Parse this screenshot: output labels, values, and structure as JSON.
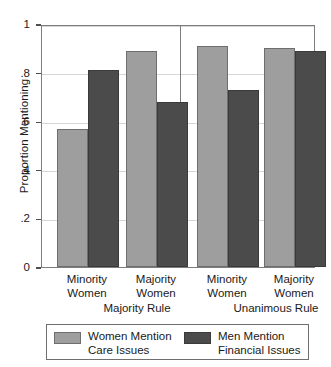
{
  "chart_data": {
    "type": "bar",
    "title": "",
    "xlabel": "",
    "ylabel": "Proportion Mentioning",
    "ylim": [
      0,
      1
    ],
    "yticks": [
      "0",
      ".2",
      ".4",
      ".6",
      ".8",
      "1"
    ],
    "ytick_values": [
      0,
      0.2,
      0.4,
      0.6,
      0.8,
      1
    ],
    "grid": true,
    "legend_position": "bottom",
    "categories": [
      "Minority Women",
      "Majority Women",
      "Minority Women",
      "Majority Women"
    ],
    "category_lines": [
      [
        "Minority",
        "Women"
      ],
      [
        "Majority",
        "Women"
      ],
      [
        "Minority",
        "Women"
      ],
      [
        "Majority",
        "Women"
      ]
    ],
    "groups": [
      {
        "label": "Majority Rule",
        "categories": [
          "Minority Women",
          "Majority Women"
        ]
      },
      {
        "label": "Unanimous Rule",
        "categories": [
          "Minority Women",
          "Majority Women"
        ]
      }
    ],
    "series": [
      {
        "name": "Women Mention Care Issues",
        "name_lines": [
          "Women Mention",
          "Care Issues"
        ],
        "color": "#9e9e9e",
        "values": [
          0.57,
          0.89,
          0.91,
          0.9
        ]
      },
      {
        "name": "Men Mention Financial Issues",
        "name_lines": [
          "Men Mention",
          "Financial Issues"
        ],
        "color": "#4b4b4b",
        "values": [
          0.81,
          0.68,
          0.73,
          0.89
        ]
      }
    ]
  },
  "axis": {
    "y_title": "Proportion Mentioning",
    "ticks": [
      {
        "label": "1",
        "value": 1
      },
      {
        "label": ".8",
        "value": 0.8
      },
      {
        "label": ".6",
        "value": 0.6
      },
      {
        "label": ".4",
        "value": 0.4
      },
      {
        "label": ".2",
        "value": 0.2
      },
      {
        "label": "0",
        "value": 0
      }
    ]
  },
  "group_labels": [
    {
      "label": "Majority Rule"
    },
    {
      "label": "Unanimous Rule"
    }
  ],
  "category_labels": [
    {
      "line1": "Minority",
      "line2": "Women"
    },
    {
      "line1": "Majority",
      "line2": "Women"
    },
    {
      "line1": "Minority",
      "line2": "Women"
    },
    {
      "line1": "Majority",
      "line2": "Women"
    }
  ],
  "legend": {
    "entries": [
      {
        "line1": "Women Mention",
        "line2": "Care Issues",
        "color": "#9e9e9e"
      },
      {
        "line1": "Men Mention",
        "line2": "Financial Issues",
        "color": "#4b4b4b"
      }
    ]
  },
  "colors": {
    "light_bar": "#9e9e9e",
    "dark_bar": "#4b4b4b",
    "frame": "#7d7d7d",
    "gridline": "#d6d6d6",
    "text": "#1a1a1a"
  }
}
